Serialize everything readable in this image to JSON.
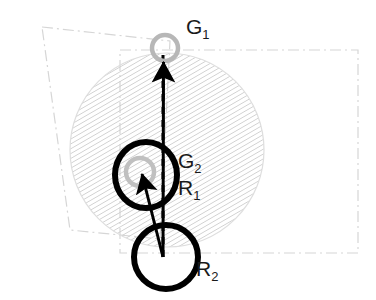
{
  "figure": {
    "type": "geometric-diagram",
    "background_color": "#ffffff",
    "width": 376,
    "height": 300,
    "labels": [
      {
        "id": "G1",
        "base": "G",
        "sub": "1",
        "x": 186,
        "y": 34
      },
      {
        "id": "G2",
        "base": "G",
        "sub": "2",
        "x": 178,
        "y": 168
      },
      {
        "id": "R1",
        "base": "R",
        "sub": "1",
        "x": 178,
        "y": 195
      },
      {
        "id": "R2",
        "base": "R",
        "sub": "2",
        "x": 196,
        "y": 276
      }
    ],
    "hatched_region": {
      "name": "reachable-area-circle",
      "shape": "circle",
      "cx": 167,
      "cy": 150,
      "r": 97,
      "hatch_angle_deg": 60,
      "hatch_color": "#c8c8c8",
      "hatch_spacing": 4,
      "outline_color": "#dcdcdc"
    },
    "bounding_boxes": [
      {
        "name": "tilted-workspace-rect",
        "style": "dash-dot",
        "color": "#d2d2d2",
        "rotation_deg": -5.5,
        "points": "42,27 170,41 160,239 70,230"
      },
      {
        "name": "axis-aligned-workspace-rect",
        "style": "dash-dot",
        "color": "#d2d2d2",
        "rotation_deg": 0,
        "points": "120,50 358,50 358,253 120,253"
      }
    ],
    "goal_markers": [
      {
        "name": "goal-marker-G1",
        "label": "G1",
        "cx": 165,
        "cy": 48,
        "r": 13,
        "stroke": "#b4b4b4",
        "stroke_width": 4,
        "fill": "none"
      },
      {
        "name": "goal-marker-G2",
        "label": "G2",
        "cx": 140,
        "cy": 172,
        "r": 14,
        "stroke": "#bebebe",
        "stroke_width": 4,
        "fill": "none"
      }
    ],
    "robot_markers": [
      {
        "name": "robot-marker-R1",
        "label": "R1",
        "cx": 146,
        "cy": 175,
        "rx": 31,
        "ry": 33,
        "stroke": "#000000",
        "stroke_width": 6,
        "fill": "none"
      },
      {
        "name": "robot-marker-R2",
        "label": "R2",
        "cx": 166,
        "cy": 257,
        "rx": 32,
        "ry": 32,
        "stroke": "#000000",
        "stroke_width": 6,
        "fill": "none"
      }
    ],
    "arrows": [
      {
        "name": "motion-arrow-R2-to-G1",
        "from_x": 163,
        "from_y": 257,
        "to_x": 163,
        "to_y": 58,
        "color": "#000000",
        "stroke_width": 3,
        "head_length": 26,
        "head_width": 17,
        "style": "solid"
      },
      {
        "name": "motion-arrow-R2-to-G2",
        "from_x": 163,
        "from_y": 257,
        "to_x": 141,
        "to_y": 172,
        "color": "#000000",
        "stroke_width": 3,
        "head_length": 24,
        "head_width": 16,
        "style": "solid"
      }
    ],
    "dashed_guides": [
      {
        "name": "vertical-reference-line",
        "from_x": 163,
        "from_y": 257,
        "to_x": 163,
        "to_y": 55,
        "color": "#000000",
        "stroke_width": 3,
        "dash": "7 6"
      }
    ]
  }
}
